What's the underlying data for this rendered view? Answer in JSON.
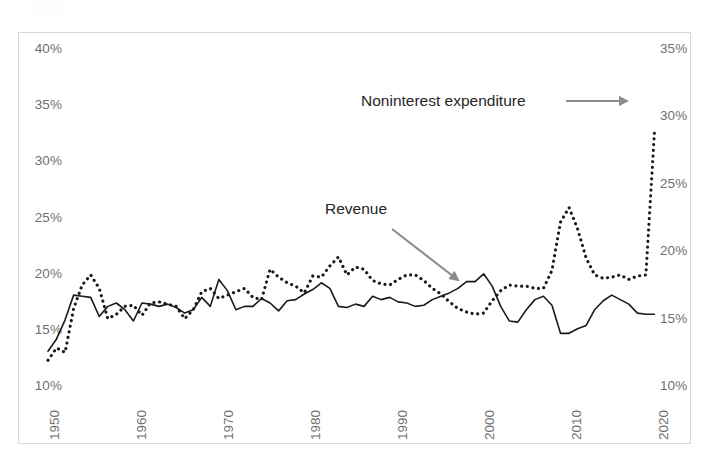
{
  "chart_data": {
    "type": "line",
    "title": "",
    "subtitle": "",
    "xlabel": "",
    "ylabel": "",
    "y_left_ticks": [
      "10%",
      "15%",
      "20%",
      "25%",
      "30%",
      "35%",
      "40%"
    ],
    "y_right_ticks": [
      "10%",
      "15%",
      "20%",
      "25%",
      "30%",
      "35%"
    ],
    "ylim_left": [
      10,
      40
    ],
    "ylim_right": [
      10,
      35
    ],
    "x_ticks": [
      "1950",
      "1960",
      "1970",
      "1980",
      "1990",
      "2000",
      "2010",
      "2020"
    ],
    "xlim": [
      1949,
      2021
    ],
    "grid": false,
    "legend_position": "inline-annotations",
    "annotations": [
      {
        "name": "noninterest-expenditure",
        "text": "Noninterest expenditure",
        "arrow": "right",
        "color": "#808080"
      },
      {
        "name": "revenue",
        "text": "Revenue",
        "arrow": "down-right",
        "color": "#808080"
      }
    ],
    "x": [
      1949,
      1950,
      1951,
      1952,
      1953,
      1954,
      1955,
      1956,
      1957,
      1958,
      1959,
      1960,
      1961,
      1962,
      1963,
      1964,
      1965,
      1966,
      1967,
      1968,
      1969,
      1970,
      1971,
      1972,
      1973,
      1974,
      1975,
      1976,
      1977,
      1978,
      1979,
      1980,
      1981,
      1982,
      1983,
      1984,
      1985,
      1986,
      1987,
      1988,
      1989,
      1990,
      1991,
      1992,
      1993,
      1994,
      1995,
      1996,
      1997,
      1998,
      1999,
      2000,
      2001,
      2002,
      2003,
      2004,
      2005,
      2006,
      2007,
      2008,
      2009,
      2010,
      2011,
      2012,
      2013,
      2014,
      2015,
      2016,
      2017,
      2018,
      2019,
      2020
    ],
    "series": [
      {
        "name": "Revenue",
        "style": "solid",
        "color": "#1a1a1a",
        "axis": "left",
        "values": [
          13.0,
          14.1,
          15.8,
          18.0,
          17.9,
          17.8,
          16.1,
          17.0,
          17.3,
          16.7,
          15.7,
          17.3,
          17.2,
          17.0,
          17.2,
          16.9,
          16.4,
          16.7,
          17.8,
          17.0,
          19.4,
          18.4,
          16.7,
          17.0,
          17.0,
          17.7,
          17.3,
          16.6,
          17.5,
          17.6,
          18.1,
          18.5,
          19.1,
          18.6,
          17.0,
          16.9,
          17.2,
          17.0,
          17.9,
          17.6,
          17.8,
          17.4,
          17.3,
          17.0,
          17.1,
          17.6,
          17.9,
          18.2,
          18.6,
          19.2,
          19.2,
          19.9,
          18.8,
          17.0,
          15.7,
          15.6,
          16.7,
          17.6,
          17.9,
          17.1,
          14.6,
          14.6,
          15.0,
          15.3,
          16.7,
          17.5,
          18.0,
          17.6,
          17.2,
          16.4,
          16.3,
          16.3
        ]
      },
      {
        "name": "Noninterest expenditure",
        "style": "dotted",
        "color": "#1a1a1a",
        "axis": "left",
        "values": [
          12.2,
          13.3,
          12.9,
          16.8,
          18.9,
          19.8,
          18.6,
          15.9,
          16.3,
          17.0,
          17.1,
          16.2,
          17.3,
          17.4,
          17.2,
          17.0,
          15.9,
          16.7,
          18.3,
          18.6,
          17.7,
          18.0,
          18.3,
          18.6,
          17.8,
          17.6,
          20.3,
          19.6,
          19.1,
          18.8,
          18.2,
          19.7,
          19.6,
          20.6,
          21.4,
          19.8,
          20.5,
          20.3,
          19.3,
          19.0,
          18.9,
          19.4,
          19.8,
          19.8,
          19.3,
          18.6,
          18.1,
          17.4,
          16.8,
          16.5,
          16.3,
          16.4,
          17.5,
          18.4,
          18.9,
          18.8,
          18.8,
          18.6,
          18.6,
          20.2,
          24.5,
          25.8,
          23.9,
          21.3,
          19.8,
          19.5,
          19.6,
          19.8,
          19.4,
          19.7,
          19.8,
          32.5
        ]
      }
    ]
  },
  "axes": {
    "left_title": "",
    "right_title": ""
  }
}
